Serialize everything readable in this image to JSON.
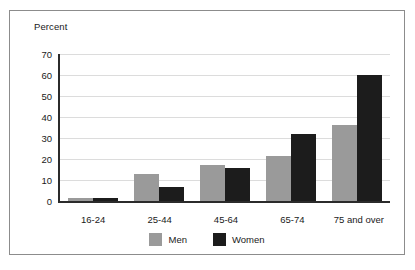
{
  "chart_data": {
    "type": "bar",
    "title": "",
    "ylabel": "Percent",
    "xlabel": "",
    "ylim": [
      0,
      70
    ],
    "yticks": [
      0,
      10,
      20,
      30,
      40,
      50,
      60,
      70
    ],
    "grid": true,
    "legend_position": "bottom",
    "categories": [
      "16-24",
      "25-44",
      "45-64",
      "65-74",
      "75 and over"
    ],
    "series": [
      {
        "name": "Men",
        "color": "#9a9a9a",
        "values": [
          1.5,
          13,
          17,
          21.5,
          36
        ]
      },
      {
        "name": "Women",
        "color": "#1c1c1c",
        "values": [
          1.5,
          6.5,
          15.5,
          32,
          60
        ]
      }
    ]
  },
  "frame": {
    "border_color": "#8c8c8c",
    "background": "#ffffff"
  }
}
